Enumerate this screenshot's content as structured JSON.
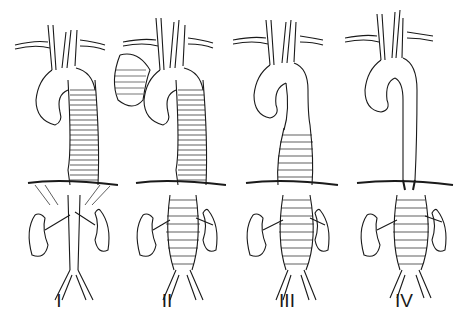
{
  "figure": {
    "panels": [
      {
        "label": "I",
        "extent": "proximal descending thoracic aorta to renal arteries",
        "aneurysm_top": 62,
        "aneurysm_bottom": 185,
        "arch_aneurysm": false
      },
      {
        "label": "II",
        "extent": "proximal descending thoracic aorta to aortic bifurcation",
        "aneurysm_top": 62,
        "aneurysm_bottom": 275,
        "arch_aneurysm": true
      },
      {
        "label": "III",
        "extent": "distal descending thoracic aorta to aortic bifurcation",
        "aneurysm_top": 125,
        "aneurysm_bottom": 275,
        "arch_aneurysm": false
      },
      {
        "label": "IV",
        "extent": "diaphragm to aortic bifurcation (abdominal aorta)",
        "aneurysm_top": 190,
        "aneurysm_bottom": 275,
        "arch_aneurysm": false
      }
    ],
    "colors": {
      "ink": "#1a1a1a",
      "background": "#ffffff"
    }
  }
}
